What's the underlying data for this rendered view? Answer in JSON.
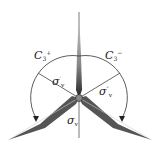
{
  "diagram": {
    "rotations": [
      {
        "symbol": "C",
        "subscript": "3",
        "superscript": "+",
        "side": "left"
      },
      {
        "symbol": "C",
        "subscript": "3",
        "superscript": "−",
        "side": "right"
      }
    ],
    "mirror_planes": [
      {
        "symbol": "σ",
        "subscript": "v",
        "prime": "′"
      },
      {
        "symbol": "σ",
        "subscript": "v",
        "prime": "″"
      },
      {
        "symbol": "σ",
        "subscript": "v",
        "prime": ""
      }
    ],
    "colors": {
      "line": "#333333",
      "blade_dark": "#222222",
      "blade_light": "#bbbbbb"
    }
  }
}
